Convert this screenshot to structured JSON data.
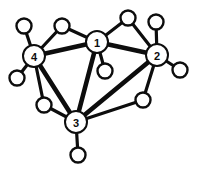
{
  "diagram": {
    "type": "node-link-graph",
    "canvas": {
      "width": 198,
      "height": 172,
      "background": "#ffffff"
    },
    "style": {
      "edge_color": "#0d0d0d",
      "node_fill": "#ffffff",
      "node_stroke": "#0d0d0d",
      "label_color": "#0d0d0d",
      "major_edge_width": 4.6,
      "minor_edge_width": 3.2,
      "major_node_radius": 11,
      "minor_node_radius": 7.5,
      "major_node_stroke_width": 2.0,
      "minor_node_stroke_width": 2.4,
      "label_font_size": 11
    },
    "nodes": [
      {
        "id": "n1",
        "label": "1",
        "x": 97,
        "y": 42,
        "r": 11,
        "kind": "major",
        "name": "node-1"
      },
      {
        "id": "n2",
        "label": "2",
        "x": 157,
        "y": 55,
        "r": 11,
        "kind": "major",
        "name": "node-2"
      },
      {
        "id": "n3",
        "label": "3",
        "x": 76,
        "y": 122,
        "r": 11,
        "kind": "major",
        "name": "node-3"
      },
      {
        "id": "n4",
        "label": "4",
        "x": 34,
        "y": 56,
        "r": 11,
        "kind": "major",
        "name": "node-4"
      },
      {
        "id": "p1",
        "label": "",
        "x": 24,
        "y": 26,
        "r": 7.5,
        "kind": "minor",
        "name": "node-pendant-upper-left"
      },
      {
        "id": "p2",
        "label": "",
        "x": 17,
        "y": 78,
        "r": 7.5,
        "kind": "minor",
        "name": "node-pendant-lower-left"
      },
      {
        "id": "p3",
        "label": "",
        "x": 62,
        "y": 26,
        "r": 7.5,
        "kind": "minor",
        "name": "node-bridge-top-left"
      },
      {
        "id": "p4",
        "label": "",
        "x": 128,
        "y": 18,
        "r": 7.5,
        "kind": "minor",
        "name": "node-bridge-top-right"
      },
      {
        "id": "p5",
        "label": "",
        "x": 156,
        "y": 22,
        "r": 7.5,
        "kind": "minor",
        "name": "node-pendant-upper-right"
      },
      {
        "id": "p6",
        "label": "",
        "x": 180,
        "y": 70,
        "r": 7.5,
        "kind": "minor",
        "name": "node-pendant-right"
      },
      {
        "id": "p7",
        "label": "",
        "x": 105,
        "y": 71,
        "r": 7.5,
        "kind": "minor",
        "name": "node-pendant-center"
      },
      {
        "id": "p8",
        "label": "",
        "x": 44,
        "y": 105,
        "r": 7.5,
        "kind": "minor",
        "name": "node-bridge-lower-left"
      },
      {
        "id": "p9",
        "label": "",
        "x": 143,
        "y": 100,
        "r": 7.5,
        "kind": "minor",
        "name": "node-bridge-lower-right"
      },
      {
        "id": "p10",
        "label": "",
        "x": 78,
        "y": 155,
        "r": 7.5,
        "kind": "minor",
        "name": "node-pendant-bottom"
      }
    ],
    "edges": [
      {
        "from": "n4",
        "to": "n1",
        "weight": "major",
        "name": "edge-4-1"
      },
      {
        "from": "n1",
        "to": "n2",
        "weight": "major",
        "name": "edge-1-2"
      },
      {
        "from": "n4",
        "to": "n3",
        "weight": "major",
        "name": "edge-4-3"
      },
      {
        "from": "n1",
        "to": "n3",
        "weight": "major",
        "name": "edge-1-3"
      },
      {
        "from": "n2",
        "to": "n3",
        "weight": "major",
        "name": "edge-2-3"
      },
      {
        "from": "n4",
        "to": "p1",
        "weight": "minor",
        "name": "edge-4-pendant-upper-left"
      },
      {
        "from": "n4",
        "to": "p2",
        "weight": "minor",
        "name": "edge-4-pendant-lower-left"
      },
      {
        "from": "n4",
        "to": "p3",
        "weight": "minor",
        "name": "edge-4-bridge-top-left"
      },
      {
        "from": "p3",
        "to": "n1",
        "weight": "minor",
        "name": "edge-bridge-top-left-1"
      },
      {
        "from": "n1",
        "to": "p4",
        "weight": "minor",
        "name": "edge-1-bridge-top-right"
      },
      {
        "from": "p4",
        "to": "n2",
        "weight": "minor",
        "name": "edge-bridge-top-right-2"
      },
      {
        "from": "n2",
        "to": "p5",
        "weight": "minor",
        "name": "edge-2-pendant-upper-right"
      },
      {
        "from": "n2",
        "to": "p6",
        "weight": "minor",
        "name": "edge-2-pendant-right"
      },
      {
        "from": "n1",
        "to": "p7",
        "weight": "minor",
        "name": "edge-1-pendant-center"
      },
      {
        "from": "n4",
        "to": "p8",
        "weight": "minor",
        "name": "edge-4-bridge-lower-left"
      },
      {
        "from": "p8",
        "to": "n3",
        "weight": "minor",
        "name": "edge-bridge-lower-left-3"
      },
      {
        "from": "n2",
        "to": "p9",
        "weight": "minor",
        "name": "edge-2-bridge-lower-right"
      },
      {
        "from": "p9",
        "to": "n3",
        "weight": "minor",
        "name": "edge-bridge-lower-right-3"
      },
      {
        "from": "n3",
        "to": "p10",
        "weight": "minor",
        "name": "edge-3-pendant-bottom"
      }
    ]
  }
}
